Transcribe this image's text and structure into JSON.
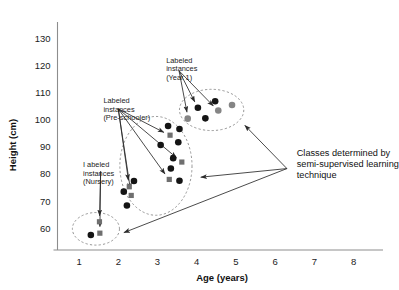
{
  "chart_data": {
    "type": "scatter",
    "title": "",
    "xlabel": "Age (years)",
    "ylabel": "Height (cm)",
    "xlim": [
      0.45,
      8.75
    ],
    "ylim": [
      52,
      136
    ],
    "xticks": [
      1,
      2,
      3,
      4,
      5,
      6,
      7,
      8
    ],
    "xtick_labels": [
      "1",
      "2",
      "3",
      "4",
      "5",
      "6",
      "7",
      "8"
    ],
    "yticks": [
      60,
      70,
      80,
      90,
      100,
      110,
      120,
      130
    ],
    "ytick_labels": [
      "60",
      "70",
      "80",
      "90",
      "100",
      "110",
      "120",
      "130"
    ],
    "grid": false,
    "legend": "none",
    "marker_kinds": {
      "circle_dark": "unlabeled instance",
      "circle_gray": "labeled instance (shaded)",
      "square_gray": "labeled instance"
    },
    "series": [
      {
        "name": "Nursery",
        "points": [
          {
            "x": 1.3,
            "y": 57.5,
            "marker": "circle_dark"
          },
          {
            "x": 1.53,
            "y": 58.2,
            "marker": "square_gray"
          },
          {
            "x": 1.52,
            "y": 62.4,
            "marker": "square_gray"
          }
        ]
      },
      {
        "name": "Pre-schooler",
        "points": [
          {
            "x": 2.22,
            "y": 68.4,
            "marker": "circle_dark"
          },
          {
            "x": 2.33,
            "y": 72.1,
            "marker": "square_gray"
          },
          {
            "x": 2.14,
            "y": 73.5,
            "marker": "circle_dark"
          },
          {
            "x": 2.28,
            "y": 75.3,
            "marker": "square_gray"
          },
          {
            "x": 2.4,
            "y": 77.4,
            "marker": "circle_dark"
          },
          {
            "x": 3.3,
            "y": 78.0,
            "marker": "square_gray"
          },
          {
            "x": 3.56,
            "y": 77.5,
            "marker": "circle_dark"
          },
          {
            "x": 3.34,
            "y": 82.0,
            "marker": "circle_dark"
          },
          {
            "x": 3.62,
            "y": 84.4,
            "marker": "square_gray"
          },
          {
            "x": 3.4,
            "y": 85.8,
            "marker": "circle_dark"
          },
          {
            "x": 3.53,
            "y": 91.7,
            "marker": "circle_dark"
          },
          {
            "x": 3.08,
            "y": 90.7,
            "marker": "circle_dark"
          },
          {
            "x": 3.32,
            "y": 94.3,
            "marker": "square_gray"
          },
          {
            "x": 3.56,
            "y": 96.6,
            "marker": "circle_dark"
          },
          {
            "x": 3.27,
            "y": 97.7,
            "marker": "circle_dark"
          }
        ]
      },
      {
        "name": "Year 1",
        "points": [
          {
            "x": 3.77,
            "y": 100.4,
            "marker": "circle_gray"
          },
          {
            "x": 4.22,
            "y": 100.5,
            "marker": "circle_dark"
          },
          {
            "x": 4.03,
            "y": 104.4,
            "marker": "circle_dark"
          },
          {
            "x": 4.55,
            "y": 103.4,
            "marker": "circle_gray"
          },
          {
            "x": 4.47,
            "y": 106.8,
            "marker": "circle_dark"
          },
          {
            "x": 4.9,
            "y": 105.4,
            "marker": "circle_gray"
          }
        ]
      }
    ],
    "clusters": [
      {
        "name": "Nursery",
        "cx": 1.43,
        "cy": 59.8,
        "rx": 0.6,
        "ry": 6.0,
        "style": "dashed"
      },
      {
        "name": "Pre-schooler",
        "cx": 2.96,
        "cy": 83.0,
        "rx": 0.92,
        "ry": 18.2,
        "style": "dashed"
      },
      {
        "name": "Year 1",
        "cx": 4.38,
        "cy": 103.6,
        "rx": 0.82,
        "ry": 7.6,
        "style": "dashed"
      }
    ],
    "annotations": [
      {
        "id": "labeled-nursery",
        "lines": [
          "I abeled",
          "instances",
          "(Nursery)"
        ],
        "text": "I abeled instances (Nursery)",
        "anchor_x": 1.55,
        "anchor_y": 81.0,
        "targets": [
          {
            "x": 1.52,
            "y": 62.4
          },
          {
            "x": 1.53,
            "y": 58.4
          }
        ]
      },
      {
        "id": "labeled-preschooler",
        "lines": [
          "Labeled",
          "instances",
          "(Pre-schooler)"
        ],
        "text": "Labeled instances (Pre-schooler)",
        "anchor_x": 2.0,
        "anchor_y": 104.0,
        "targets": [
          {
            "x": 3.3,
            "y": 94.3
          },
          {
            "x": 3.6,
            "y": 84.6
          },
          {
            "x": 3.28,
            "y": 78.2
          },
          {
            "x": 2.28,
            "y": 75.5
          },
          {
            "x": 2.33,
            "y": 72.3
          }
        ]
      },
      {
        "id": "labeled-year1",
        "lines": [
          "Labeled",
          "instances",
          "(Year 1)"
        ],
        "text": "Labeled instances (Year 1)",
        "anchor_x": 3.55,
        "anchor_y": 118.0,
        "targets": [
          {
            "x": 4.53,
            "y": 103.5
          },
          {
            "x": 4.02,
            "y": 104.6
          },
          {
            "x": 3.78,
            "y": 100.6
          }
        ]
      },
      {
        "id": "classes-callout",
        "lines": [
          "Classes determined by",
          "semi-supervised learning",
          "technique"
        ],
        "text": "Classes determined by semi-supervised learning technique",
        "anchor_x": 6.3,
        "anchor_y": 82.0,
        "targets": [
          {
            "x": 5.12,
            "y": 99.5
          },
          {
            "x": 3.95,
            "y": 78.6
          },
          {
            "x": 2.0,
            "y": 57.6
          }
        ]
      }
    ]
  },
  "figure": {
    "background_color": "#ffffff",
    "axis_color": "#8d8d8d",
    "text_color": "#1c1c1c",
    "marker_dark": "#141414",
    "marker_gray": "#858585"
  }
}
